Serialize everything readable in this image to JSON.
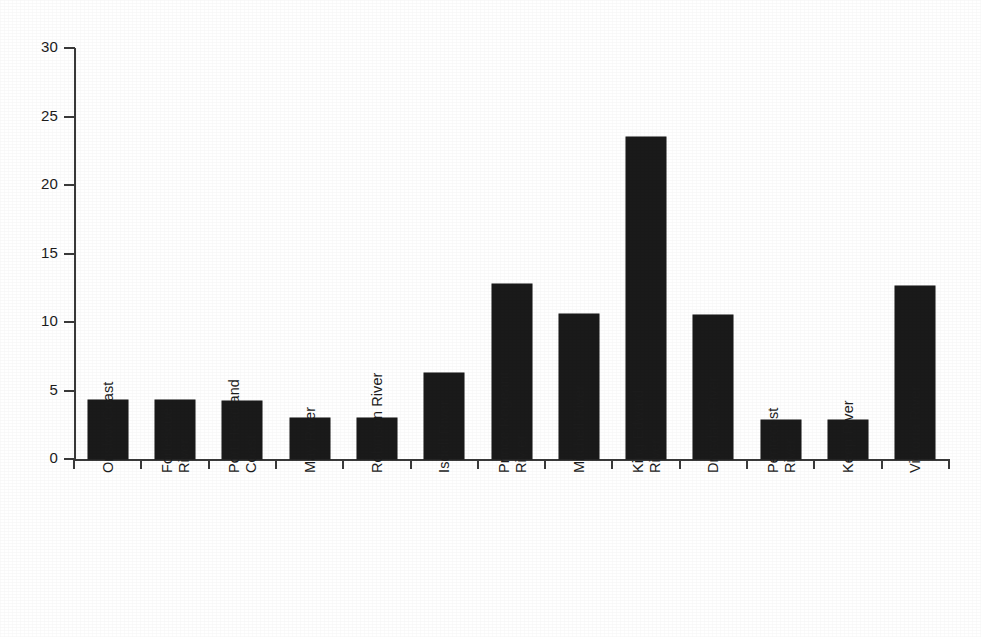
{
  "chart_data": {
    "type": "bar",
    "title": "",
    "subtitle": "",
    "xlabel": "",
    "ylabel": "",
    "ylim": [
      0,
      30
    ],
    "yticks": [
      0,
      5,
      10,
      15,
      20,
      25,
      30
    ],
    "ytick_labels": [
      "0",
      "5",
      "10",
      "15",
      "20",
      "25",
      "30"
    ],
    "grid": false,
    "legend": null,
    "bar_color": "#1a1a1a",
    "background_color": "#ffffff",
    "axis_color": "#3a3a3a",
    "categories": [
      "Onslow Coast",
      "Fortescue River",
      "Port Headland Coast",
      "May River",
      "Robinson River",
      "Isdell River",
      "Prince Regeant River",
      "Mitchell River",
      "King Edward River",
      "Drysdale River",
      "Pentecost River",
      "Keep River",
      "Victoria River"
    ],
    "category_label_lines": [
      [
        "Onslow Coast"
      ],
      [
        "Fortescue",
        "River"
      ],
      [
        "Port Headland",
        "Coast"
      ],
      [
        "May River"
      ],
      [
        "Robinson River"
      ],
      [
        "Isdell River"
      ],
      [
        "Prince Regeant",
        "Riv er"
      ],
      [
        "Mitchell River"
      ],
      [
        "King Edward",
        "River"
      ],
      [
        "Drysdale River"
      ],
      [
        "Pentecost",
        "River"
      ],
      [
        "Keep River"
      ],
      [
        "Victoria River"
      ]
    ],
    "values": [
      4.3,
      4.3,
      4.25,
      3.0,
      3.0,
      6.25,
      12.8,
      10.6,
      23.5,
      10.5,
      2.85,
      2.85,
      12.65
    ]
  }
}
